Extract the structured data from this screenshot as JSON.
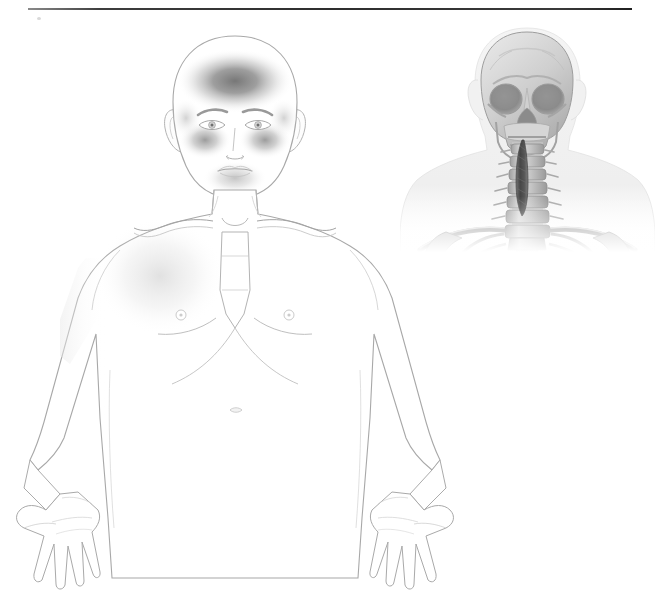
{
  "document": {
    "title": "Anatomical Pain Distribution Diagram",
    "type": "medical-illustration",
    "background_color": "#ffffff",
    "width": 659,
    "height": 611
  },
  "divider": {
    "name": "top-horizontal-rule",
    "color": "#2e2e2e"
  },
  "body_figure": {
    "name": "frontal-body-figure",
    "view": "anterior",
    "sex_presentation": "male",
    "outline_color": "#9a9a9a",
    "fill_color": "#ffffff",
    "regions": [
      "head",
      "face",
      "neck",
      "shoulders",
      "chest",
      "abdomen",
      "arms",
      "hands"
    ],
    "features": {
      "eyes": "open",
      "eyebrows": "present",
      "ears": "present",
      "hair": "none",
      "nipples": "visible",
      "navel": "visible",
      "clavicles": "visible",
      "sternum": "visible",
      "hand_position": "palms-forward-open"
    }
  },
  "pain_shading": {
    "name": "pain-distribution-overlay",
    "style": "grayscale-gradient",
    "darkest_color": "#6a6a6a",
    "mid_color": "#9b9b9b",
    "light_color": "#d4d4d4",
    "areas": [
      {
        "label": "Forehead / frontal region",
        "intensity": "severe",
        "opacity": 0.62
      },
      {
        "label": "Left periorbital / maxillary cheek",
        "intensity": "moderate",
        "opacity": 0.45
      },
      {
        "label": "Right periorbital / maxillary cheek",
        "intensity": "moderate",
        "opacity": 0.45
      },
      {
        "label": "Chin / mandibular region",
        "intensity": "mild",
        "opacity": 0.3
      },
      {
        "label": "Left upper chest / pectoral",
        "intensity": "faint",
        "opacity": 0.16
      }
    ]
  },
  "skeleton_inset": {
    "name": "skull-cervical-spine-inset",
    "view": "anterior",
    "bone_color": "#b9b9b9",
    "bone_light": "#e2e2e2",
    "bone_shadow": "#8f8f8f",
    "soft_tissue_color": "#ededed",
    "structures": [
      "cranium",
      "orbits",
      "nasal aperture",
      "zygomatic arches",
      "maxilla",
      "mandible",
      "cervical vertebrae",
      "clavicles",
      "scapulae",
      "upper ribs",
      "sternum"
    ],
    "highlight": {
      "name": "cervical-highlight-structure",
      "label": "Highlighted cervical spinal segment",
      "color": "#4a4a4a",
      "orientation": "vertical",
      "span": "C1 to C6"
    }
  }
}
